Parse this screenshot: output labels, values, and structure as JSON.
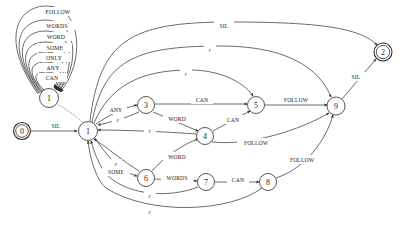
{
  "diagram": {
    "type": "finite-state-automaton",
    "width": 420,
    "height": 225,
    "stroke_color": "#2b2b2b",
    "background_color": "#ffffff",
    "epsilon_symbol": "ε"
  },
  "nodes": [
    {
      "id": "0",
      "label": "0",
      "x": 22,
      "y": 131,
      "r": 8.5,
      "double": true,
      "role": "start-state"
    },
    {
      "id": "1",
      "label": "1",
      "x": 88,
      "y": 131,
      "r": 9.5,
      "double": false,
      "role": "hub-state"
    },
    {
      "id": "1b",
      "label": "1",
      "x": 49,
      "y": 98,
      "r": 9.5,
      "double": false,
      "role": "self-loop-state"
    },
    {
      "id": "3",
      "label": "3",
      "x": 146,
      "y": 105,
      "r": 8.5,
      "double": false,
      "role": "state"
    },
    {
      "id": "4",
      "label": "4",
      "x": 205,
      "y": 136,
      "r": 8.5,
      "double": false,
      "role": "state"
    },
    {
      "id": "5",
      "label": "5",
      "x": 256,
      "y": 105,
      "r": 8.5,
      "double": false,
      "role": "state"
    },
    {
      "id": "6",
      "label": "6",
      "x": 146,
      "y": 178,
      "r": 8.5,
      "double": false,
      "role": "state"
    },
    {
      "id": "7",
      "label": "7",
      "x": 206,
      "y": 182,
      "r": 8.5,
      "double": false,
      "role": "state"
    },
    {
      "id": "8",
      "label": "8",
      "x": 268,
      "y": 182,
      "r": 8.5,
      "double": false,
      "role": "state"
    },
    {
      "id": "9",
      "label": "9",
      "x": 336,
      "y": 106,
      "r": 9.0,
      "double": false,
      "role": "state"
    },
    {
      "id": "2",
      "label": "2",
      "x": 383,
      "y": 52,
      "r": 9.0,
      "double": true,
      "role": "final-state"
    }
  ],
  "self_loops": {
    "node": "1b",
    "labels": [
      {
        "text": "FOLLOW",
        "x": 58,
        "y": 12
      },
      {
        "text": "WORDS",
        "x": 57,
        "y": 26
      },
      {
        "text": "WORD",
        "x": 56,
        "y": 37
      },
      {
        "text": "SOME",
        "x": 55,
        "y": 48
      },
      {
        "text": "ONLY",
        "x": 54,
        "y": 58
      },
      {
        "text": "ANY",
        "x": 53,
        "y": 68
      },
      {
        "text": "CAN",
        "x": 52,
        "y": 78
      }
    ]
  },
  "edges": [
    {
      "from": "0",
      "to": "1",
      "label": "SIL",
      "label_x": 56,
      "label_y": 126
    },
    {
      "from": "1",
      "to": "2",
      "label": "SIL",
      "label_x": 224,
      "label_y": 26
    },
    {
      "from": "1",
      "to": "9",
      "label": "ε",
      "label_x": 210,
      "label_y": 50
    },
    {
      "from": "1",
      "to": "5",
      "label": "ε",
      "label_x": 186,
      "label_y": 74
    },
    {
      "from": "1",
      "to": "3",
      "label": "ANY",
      "label_x": 116,
      "label_y": 110
    },
    {
      "from": "3",
      "to": "5",
      "label": "CAN",
      "label_x": 202,
      "label_y": 100
    },
    {
      "from": "3",
      "to": "4",
      "label": "WORD",
      "label_x": 177,
      "label_y": 119
    },
    {
      "from": "3",
      "to": "1",
      "label": "ε",
      "label_x": 118,
      "label_y": 120
    },
    {
      "from": "4",
      "to": "5",
      "label": "CAN",
      "label_x": 233,
      "label_y": 120
    },
    {
      "from": "4",
      "to": "1",
      "label": "ε",
      "label_x": 150,
      "label_y": 131
    },
    {
      "from": "5",
      "to": "9",
      "label": "FOLLOW",
      "label_x": 296,
      "label_y": 100
    },
    {
      "from": "4",
      "to": "9",
      "label": "FOLLOW",
      "label_x": 256,
      "label_y": 143
    },
    {
      "from": "1",
      "to": "6",
      "label": "SOME",
      "label_x": 116,
      "label_y": 172
    },
    {
      "from": "6",
      "to": "4",
      "label": "WORD",
      "label_x": 177,
      "label_y": 157
    },
    {
      "from": "6",
      "to": "7",
      "label": "WORDS",
      "label_x": 177,
      "label_y": 178
    },
    {
      "from": "7",
      "to": "8",
      "label": "CAN",
      "label_x": 238,
      "label_y": 180
    },
    {
      "from": "6",
      "to": "1",
      "label": "ε",
      "label_x": 116,
      "label_y": 164
    },
    {
      "from": "7",
      "to": "1",
      "label": "ε",
      "label_x": 150,
      "label_y": 196
    },
    {
      "from": "8",
      "to": "1",
      "label": "ε",
      "label_x": 150,
      "label_y": 212
    },
    {
      "from": "8",
      "to": "9",
      "label": "FOLLOW",
      "label_x": 302,
      "label_y": 160
    },
    {
      "from": "9",
      "to": "2",
      "label": "SIL",
      "label_x": 356,
      "label_y": 77
    }
  ]
}
